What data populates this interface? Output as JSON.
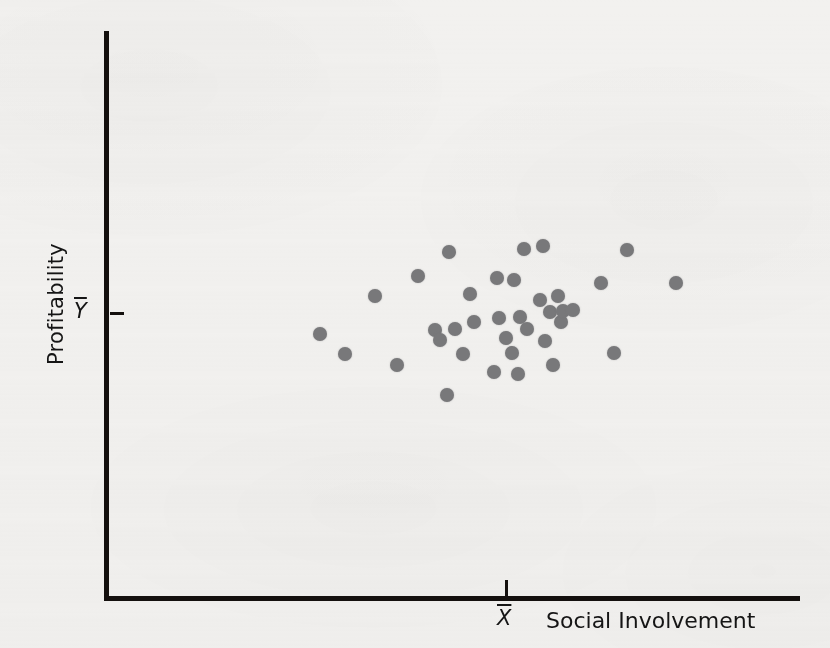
{
  "chart_data": {
    "type": "scatter",
    "title": "",
    "subtitle": "",
    "xlabel": "Social Involvement",
    "ylabel": "Profitability",
    "x_tick_labels": [
      "X̄"
    ],
    "y_tick_labels": [
      "Ȳ"
    ],
    "x_tick_label_plain": "X",
    "y_tick_label_plain": "Y",
    "grid": false,
    "legend": null,
    "annotation": "No relationship between social involvement and profitability; points scatter randomly around the means.",
    "axis_origin_px": [
      105,
      598
    ],
    "x_mean_px": 507,
    "y_mean_px": 313,
    "marker": {
      "shape": "circle",
      "color": "#78787a",
      "size_px": 14
    },
    "point_count": 35,
    "points_px": [
      [
        320,
        334
      ],
      [
        345,
        354
      ],
      [
        375,
        296
      ],
      [
        397,
        365
      ],
      [
        418,
        276
      ],
      [
        435,
        330
      ],
      [
        440,
        340
      ],
      [
        447,
        395
      ],
      [
        449,
        252
      ],
      [
        455,
        329
      ],
      [
        463,
        354
      ],
      [
        470,
        294
      ],
      [
        474,
        322
      ],
      [
        494,
        372
      ],
      [
        497,
        278
      ],
      [
        499,
        318
      ],
      [
        506,
        338
      ],
      [
        512,
        353
      ],
      [
        514,
        280
      ],
      [
        518,
        374
      ],
      [
        520,
        317
      ],
      [
        524,
        249
      ],
      [
        527,
        329
      ],
      [
        540,
        300
      ],
      [
        543,
        246
      ],
      [
        545,
        341
      ],
      [
        550,
        312
      ],
      [
        553,
        365
      ],
      [
        558,
        296
      ],
      [
        561,
        322
      ],
      [
        563,
        311
      ],
      [
        573,
        310
      ],
      [
        601,
        283
      ],
      [
        614,
        353
      ],
      [
        627,
        250
      ],
      [
        676,
        283
      ]
    ]
  },
  "figure": {
    "background_color": "#f2f1ef",
    "ink_color": "#14100e",
    "width_px": 830,
    "height_px": 648
  }
}
